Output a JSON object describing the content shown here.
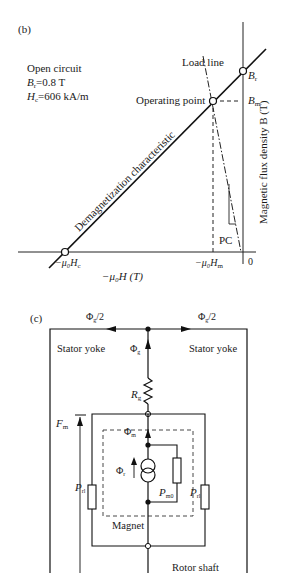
{
  "panel_b": {
    "label": "(b)",
    "conditions": {
      "line1": "Open circuit",
      "br_sym": "B",
      "br_sub": "r",
      "br_val": "=0.8 T",
      "hc_sym": "H",
      "hc_sub": "c",
      "hc_val": "=606 kA/m"
    },
    "load_line_label": "Load line",
    "operating_point_label": "Operating point",
    "demag_label": "Demagnetization characteristic",
    "br_label_sym": "B",
    "br_label_sub": "r",
    "bm_label_sym": "B",
    "bm_label_sub": "m",
    "y_axis_label": "Magnetic flux density B (T)",
    "x_axis_label": "−μ₀H (T)",
    "hc_tick": "−μ₀H",
    "hc_tick_sub": "c",
    "hm_tick": "−μ₀H",
    "hm_tick_sub": "m",
    "zero_tick": "0",
    "pc_label": "PC"
  },
  "panel_c": {
    "label": "(c)",
    "flux_half_left": "Φ",
    "flux_half_left_sub": "g",
    "flux_half_left_suffix": "/2",
    "flux_half_right": "Φ",
    "flux_half_right_sub": "g",
    "flux_half_right_suffix": "/2",
    "stator_left": "Stator yoke",
    "stator_right": "Stator yoke",
    "flux_gap": "Φ",
    "flux_gap_sub": "g",
    "rg_sym": "R",
    "rg_sub": "g",
    "fm_sym": "F",
    "fm_sub": "m",
    "phi_m": "Φ",
    "phi_m_sub": "m",
    "phi_r": "Φ",
    "phi_r_sub": "r",
    "prl_left_sym": "P",
    "prl_left_sub": "rl",
    "prl_right_sym": "P",
    "prl_right_sub": "rl",
    "pm0_sym": "P",
    "pm0_sub": "m0",
    "magnet_label": "Magnet",
    "rotor_label": "Rotor shaft"
  }
}
